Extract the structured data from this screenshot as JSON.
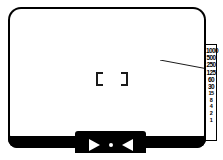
{
  "diagram": {
    "colors": {
      "frame": "#000000",
      "screen": "#ffffff",
      "marks": "#000000",
      "tab_marks": "#ffffff"
    }
  },
  "viewfinder": {
    "frame_name": "viewfinder-frame",
    "screen_name": "viewfinder-screen"
  },
  "focus": {
    "bracket_left": "[",
    "bracket_right": "]"
  },
  "shutter_scale": {
    "label": "Shutter speed scale",
    "ticks": [
      "1000",
      "500",
      "250",
      "125",
      "60",
      "30",
      "15",
      "8",
      "4",
      "2",
      "1"
    ]
  },
  "indicator_tab": {
    "left_marker": "right-triangle",
    "center_marker": "dot",
    "right_marker": "left-triangle"
  },
  "leader": {
    "name": "pointer-leader-line"
  }
}
